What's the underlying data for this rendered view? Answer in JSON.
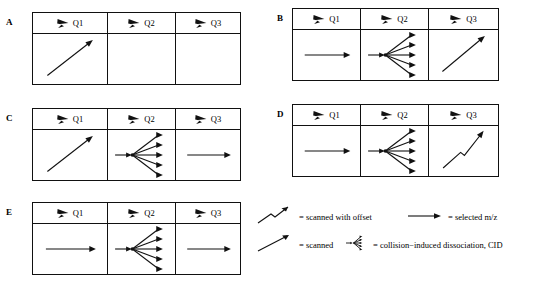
{
  "figure": {
    "quadrupole_labels": [
      "Q1",
      "Q2",
      "Q3"
    ],
    "header_icon": "chevron-arrowhead-icon"
  },
  "panels": [
    {
      "letter": "A",
      "name": "panel-a-q1-scan",
      "cells": [
        {
          "q": "Q1",
          "mode": "scanned"
        },
        {
          "q": "Q2",
          "mode": "empty"
        },
        {
          "q": "Q3",
          "mode": "empty"
        }
      ]
    },
    {
      "letter": "B",
      "name": "panel-b-product-ion-scan",
      "cells": [
        {
          "q": "Q1",
          "mode": "selected"
        },
        {
          "q": "Q2",
          "mode": "cid"
        },
        {
          "q": "Q3",
          "mode": "scanned"
        }
      ]
    },
    {
      "letter": "C",
      "name": "panel-c-precursor-ion-scan",
      "cells": [
        {
          "q": "Q1",
          "mode": "scanned"
        },
        {
          "q": "Q2",
          "mode": "cid"
        },
        {
          "q": "Q3",
          "mode": "selected"
        }
      ]
    },
    {
      "letter": "D",
      "name": "panel-d-neutral-loss-scan",
      "cells": [
        {
          "q": "Q1",
          "mode": "selected"
        },
        {
          "q": "Q2",
          "mode": "cid"
        },
        {
          "q": "Q3",
          "mode": "scanned-offset"
        }
      ]
    },
    {
      "letter": "E",
      "name": "panel-e-selected-reaction-monitoring",
      "cells": [
        {
          "q": "Q1",
          "mode": "selected"
        },
        {
          "q": "Q2",
          "mode": "cid"
        },
        {
          "q": "Q3",
          "mode": "selected"
        }
      ]
    }
  ],
  "legend": {
    "entries": [
      {
        "icon": "zigzag-diagonal-arrow-icon",
        "label": "= scanned with offset"
      },
      {
        "icon": "horizontal-arrow-icon",
        "label": "= selected m/z"
      },
      {
        "icon": "diagonal-arrow-icon",
        "label": "= scanned"
      },
      {
        "icon": "cid-fan-icon",
        "label": "= collision−induced dissociation, CID"
      }
    ]
  },
  "colors": {
    "line": "#111111",
    "background": "#ffffff"
  }
}
